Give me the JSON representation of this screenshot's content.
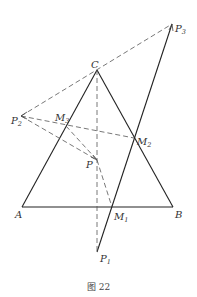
{
  "caption": "图 22",
  "points": {
    "A": {
      "label": "A",
      "x": 22,
      "y": 207
    },
    "B": {
      "label": "B",
      "x": 173,
      "y": 207
    },
    "C": {
      "label": "C",
      "x": 97,
      "y": 70
    },
    "P": {
      "label": "P",
      "x": 97,
      "y": 160
    },
    "P1": {
      "label": "P",
      "sub": "1",
      "x": 97,
      "y": 252
    },
    "P2": {
      "label": "P",
      "sub": "2",
      "x": 21,
      "y": 116
    },
    "P3": {
      "label": "P",
      "sub": "3",
      "x": 172,
      "y": 24
    },
    "M1": {
      "label": "M",
      "sub": "1",
      "x": 112,
      "y": 207
    },
    "M2": {
      "label": "M",
      "sub": "2",
      "x": 134,
      "y": 138
    },
    "M3": {
      "label": "M",
      "sub": "3",
      "x": 66,
      "y": 126
    }
  }
}
